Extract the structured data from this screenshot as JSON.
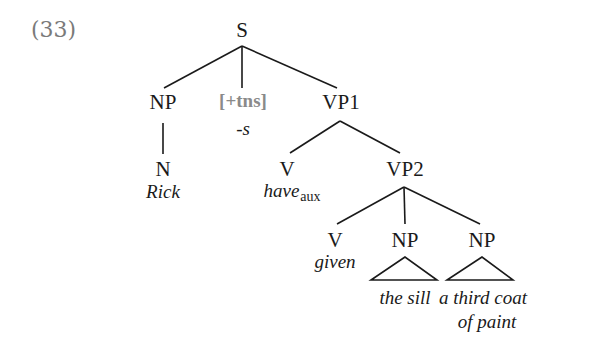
{
  "example_number": "(33)",
  "colors": {
    "ink": "#1a1a1a",
    "feature": "#8a8a8a",
    "example_number": "#7a7a7a"
  },
  "tree": {
    "S": {
      "label": "S"
    },
    "NP_subj": {
      "label": "NP",
      "child": {
        "label": "N",
        "word": "Rick"
      }
    },
    "INFL": {
      "label": "[+tns]",
      "word": "-s"
    },
    "VP1": {
      "label": "VP1",
      "V": {
        "label": "V",
        "word": "have",
        "subscript": "aux"
      },
      "VP2": {
        "label": "VP2",
        "V": {
          "label": "V",
          "word": "given"
        },
        "NP1": {
          "label": "NP",
          "word": "the sill"
        },
        "NP2": {
          "label": "NP",
          "word_line1": "a third coat",
          "word_line2": "of paint"
        }
      }
    }
  }
}
